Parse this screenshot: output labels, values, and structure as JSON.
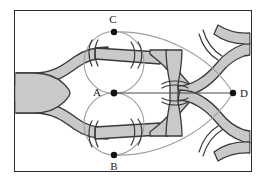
{
  "figure": {
    "frame": {
      "x": 14,
      "y": 10,
      "width": 238,
      "height": 162,
      "stroke_color": "#2b2b2b"
    },
    "colors": {
      "band_fill": "#c9c9c9",
      "band_edge": "#3a3a3a",
      "curve_stroke": "#9a9a9a",
      "axis_stroke": "#4a4a4a",
      "vertex_fill": "#111111",
      "label_color": "#1a1a1a",
      "background": "#ffffff"
    },
    "vertices": [
      {
        "id": "C",
        "label": "C",
        "x": 114,
        "y": 32,
        "label_x": 113,
        "label_y": 23,
        "label_anchor": "middle"
      },
      {
        "id": "A",
        "label": "A",
        "x": 114,
        "y": 93,
        "label_x": 97,
        "label_y": 96,
        "label_anchor": "middle"
      },
      {
        "id": "B",
        "label": "B",
        "x": 114,
        "y": 155,
        "label_x": 114,
        "label_y": 170,
        "label_anchor": "middle"
      },
      {
        "id": "D",
        "label": "D",
        "x": 233,
        "y": 93,
        "label_x": 244,
        "label_y": 97,
        "label_anchor": "middle"
      }
    ],
    "edges": [
      {
        "name": "segment-A-D",
        "from": "A",
        "to": "D",
        "type": "straight"
      },
      {
        "name": "ellipse-A-C",
        "from": "A",
        "to": "C",
        "type": "ellipse"
      },
      {
        "name": "ellipse-A-B",
        "from": "A",
        "to": "B",
        "type": "ellipse"
      },
      {
        "name": "arc-C-D",
        "from": "C",
        "to": "D",
        "type": "arc"
      },
      {
        "name": "arc-B-D",
        "from": "B",
        "to": "D",
        "type": "arc"
      }
    ],
    "bands": {
      "count": 7,
      "description": "shaded ribbon bands branching from left trunk into upper and lower loops rejoining at right"
    },
    "cut_marks": {
      "count": 10,
      "description": "paired parenthesis-shaped cut arcs crossing the ribbon bands"
    }
  }
}
